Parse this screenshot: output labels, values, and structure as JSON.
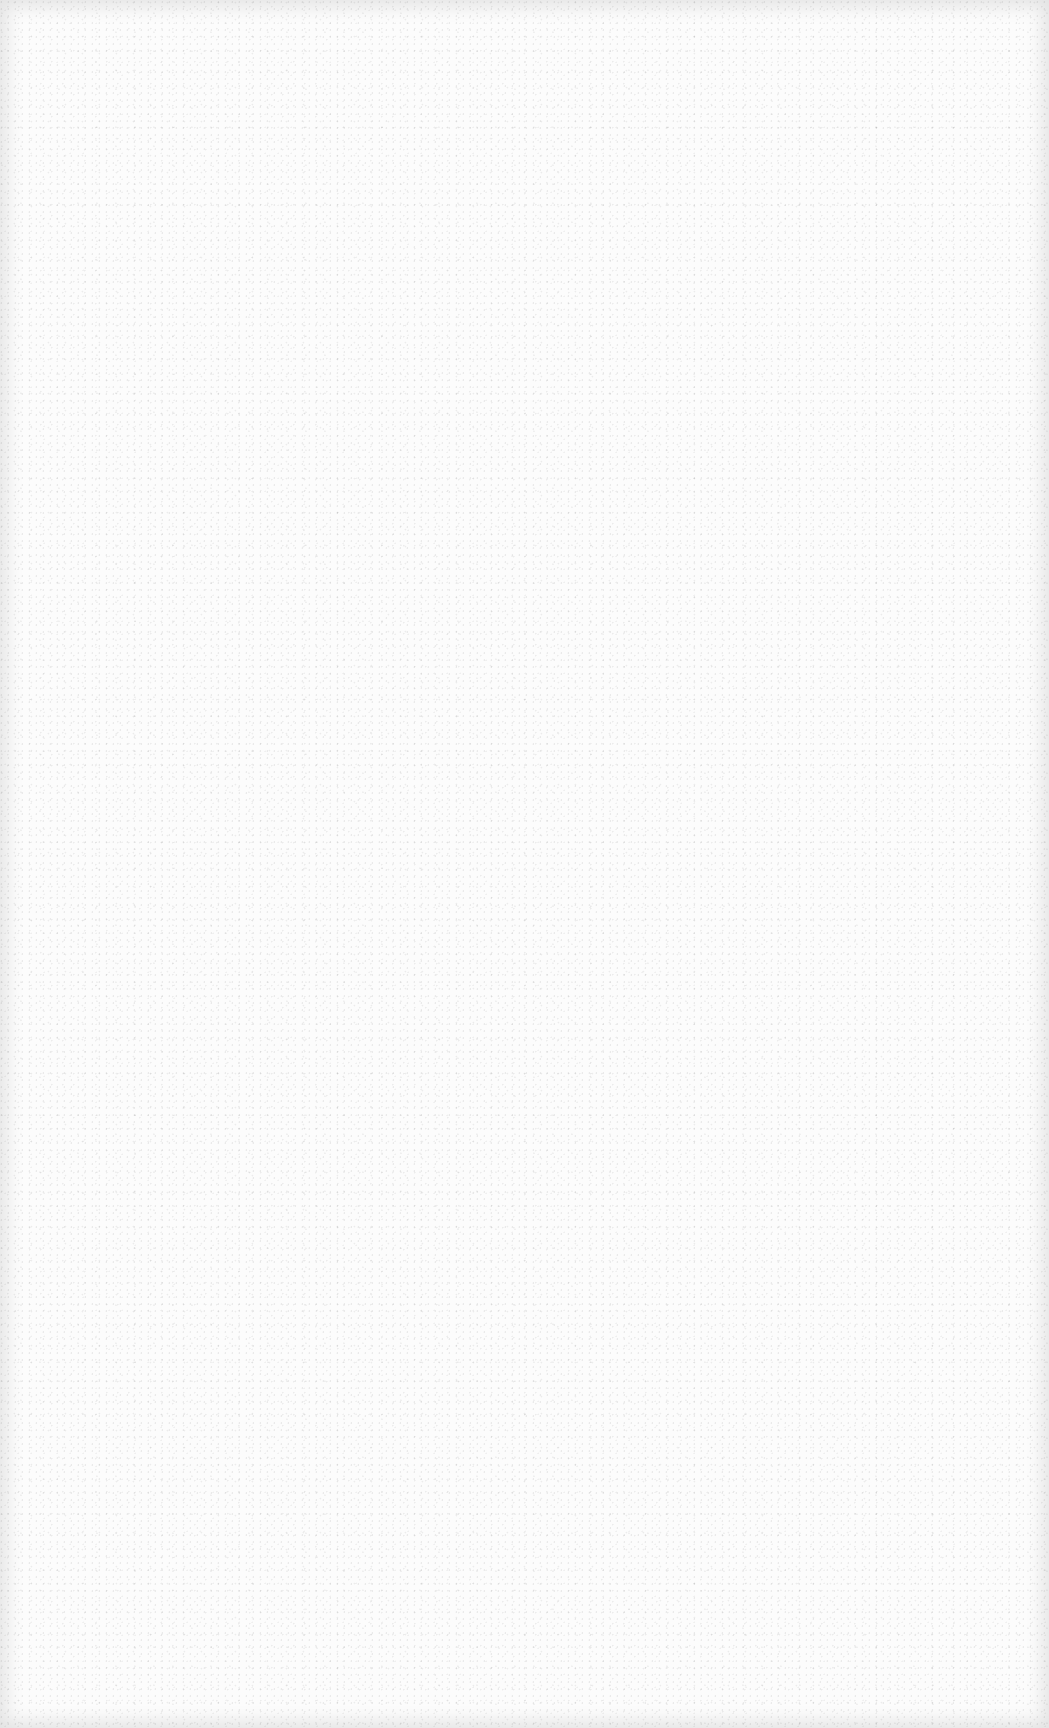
{
  "page": {
    "background_color": "#fcfcfc",
    "content": []
  }
}
